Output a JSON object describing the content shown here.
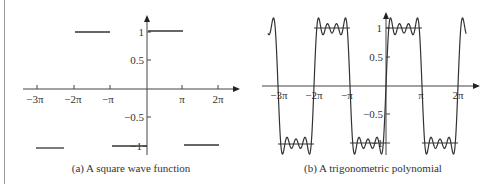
{
  "chart_data": [
    {
      "type": "line",
      "title": "",
      "caption": "(a) A square wave function",
      "xlabel": "",
      "ylabel": "",
      "x_ticks": [
        -9.4248,
        -6.2832,
        -3.1416,
        3.1416,
        6.2832
      ],
      "x_tick_labels": [
        "−3π",
        "−2π",
        "−π",
        "π",
        "2π"
      ],
      "y_ticks": [
        1,
        0.5,
        -0.5,
        -1
      ],
      "y_tick_labels": [
        "1",
        "0.5",
        "−0.5",
        "−1"
      ],
      "xlim": [
        -10.5,
        8.8
      ],
      "ylim": [
        -1.25,
        1.25
      ],
      "grid": false,
      "legend": null,
      "series": [
        {
          "name": "square wave",
          "segments": [
            {
              "x": [
                -9.4248,
                -6.9
              ],
              "y": [
                -1,
                -1
              ]
            },
            {
              "x": [
                -6.2832,
                -3.1416
              ],
              "y": [
                1,
                1
              ]
            },
            {
              "x": [
                -3.1416,
                0
              ],
              "y": [
                -1,
                -1
              ]
            },
            {
              "x": [
                0,
                3.1416
              ],
              "y": [
                1,
                1
              ]
            },
            {
              "x": [
                3.1416,
                6.2832
              ],
              "y": [
                -1,
                -1
              ]
            }
          ]
        }
      ]
    },
    {
      "type": "line",
      "title": "",
      "caption": "(b) A trigonometric polynomial",
      "xlabel": "",
      "ylabel": "",
      "x_ticks": [
        -9.4248,
        -6.2832,
        -3.1416,
        3.1416,
        6.2832
      ],
      "x_tick_labels": [
        "−3π",
        "−2π",
        "−π",
        "π",
        "2π"
      ],
      "y_ticks": [
        1,
        0.5,
        -0.5,
        -1
      ],
      "y_tick_labels": [
        "1",
        "0.5",
        "−0.5",
        "−1"
      ],
      "xlim": [
        -10.5,
        8.8
      ],
      "ylim": [
        -1.25,
        1.25
      ],
      "grid": false,
      "legend": null,
      "series": [
        {
          "name": "trigonometric polynomial",
          "formula": "(4/pi) * (sin x + sin 3x/3 + sin 5x/5 + sin 7x/7)",
          "x_range": [
            -10.3,
            7.0
          ],
          "peak_overshoot": 1.15
        },
        {
          "name": "reference levels",
          "segments": [
            {
              "x": [
                -9.4248,
                -6.2832
              ],
              "y": [
                -1,
                -1
              ]
            },
            {
              "x": [
                -6.2832,
                -3.1416
              ],
              "y": [
                1,
                1
              ]
            },
            {
              "x": [
                -3.1416,
                0
              ],
              "y": [
                -1,
                -1
              ]
            },
            {
              "x": [
                0,
                3.1416
              ],
              "y": [
                1,
                1
              ]
            },
            {
              "x": [
                3.1416,
                6.2832
              ],
              "y": [
                -1,
                -1
              ]
            }
          ]
        }
      ]
    }
  ],
  "captions": {
    "left": "(a) A square wave function",
    "right": "(b) A trigonometric polynomial"
  },
  "labels": {
    "left": {
      "x": [
        "−3π",
        "−2π",
        "−π",
        "π",
        "2π"
      ],
      "y": [
        "1",
        "0.5",
        "−0.5",
        "−1"
      ]
    },
    "right": {
      "x": [
        "−3π",
        "−2π",
        "−π",
        "π",
        "2π"
      ],
      "y": [
        "1",
        "0.5",
        "−0.5",
        "−1"
      ]
    }
  }
}
